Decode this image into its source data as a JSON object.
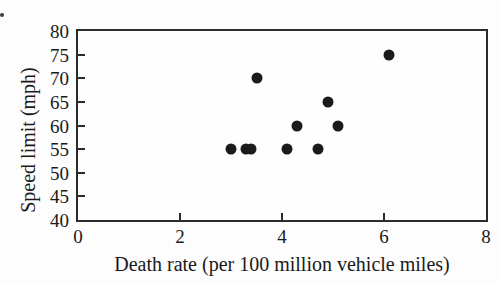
{
  "page": {
    "corner_mark_note": "cropped period of exercise number at top-left"
  },
  "chart_data": {
    "type": "scatter",
    "title": "",
    "xlabel": "Death rate (per 100 million vehicle miles)",
    "ylabel": "Speed limit (mph)",
    "xlim": [
      0,
      8
    ],
    "ylim": [
      40,
      80
    ],
    "x_ticks": [
      0,
      2,
      4,
      6,
      8
    ],
    "y_ticks": [
      40,
      45,
      50,
      55,
      60,
      65,
      70,
      75,
      80
    ],
    "grid": false,
    "legend": null,
    "marker_color": "#1b1b1b",
    "axis_color": "#2b2b2b",
    "points": [
      {
        "x": 3.0,
        "y": 55
      },
      {
        "x": 3.3,
        "y": 55
      },
      {
        "x": 3.4,
        "y": 55
      },
      {
        "x": 3.5,
        "y": 70
      },
      {
        "x": 4.1,
        "y": 55
      },
      {
        "x": 4.3,
        "y": 60
      },
      {
        "x": 4.7,
        "y": 55
      },
      {
        "x": 4.9,
        "y": 65
      },
      {
        "x": 5.1,
        "y": 60
      },
      {
        "x": 6.1,
        "y": 75
      }
    ]
  }
}
